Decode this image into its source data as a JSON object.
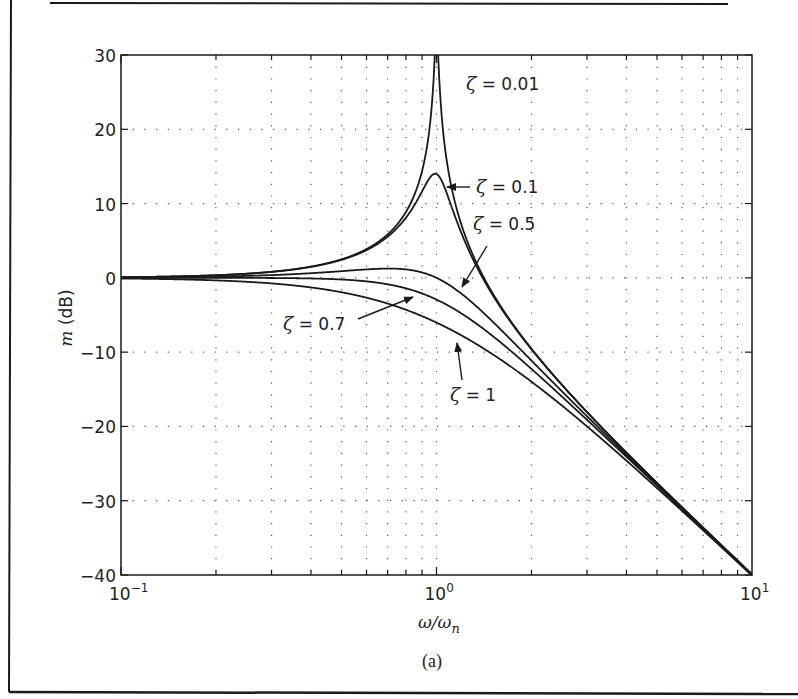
{
  "figure": {
    "caption": "(a)",
    "frame_color": "#1a1a1a",
    "curve_color": "#1a1a1a",
    "grid_color": "#555555"
  },
  "chart_data": {
    "type": "line",
    "title": "",
    "subtitle": "Second-order system magnitude response",
    "xlabel": "ω/ω",
    "xlabel_sub": "n",
    "ylabel_italic": "m",
    "ylabel_rest": " (dB)",
    "xscale": "log",
    "xlim": [
      0.1,
      10
    ],
    "ylim": [
      -40,
      30
    ],
    "grid": true,
    "grid_style": "dotted",
    "legend": "none (inline annotations with arrows)",
    "x_ticks": [
      {
        "value": 0.1,
        "base": "10",
        "exp": "−1"
      },
      {
        "value": 1,
        "base": "10",
        "exp": "0"
      },
      {
        "value": 10,
        "base": "10",
        "exp": "1"
      }
    ],
    "y_ticks": [
      {
        "value": 30,
        "label": "30"
      },
      {
        "value": 20,
        "label": "20"
      },
      {
        "value": 10,
        "label": "10"
      },
      {
        "value": 0,
        "label": "0"
      },
      {
        "value": -10,
        "label": "−10"
      },
      {
        "value": -20,
        "label": "−20"
      },
      {
        "value": -30,
        "label": "−30"
      },
      {
        "value": -40,
        "label": "−40"
      }
    ],
    "formula": "m = -20*log10(sqrt((1 - r^2)^2 + (2*zeta*r)^2)), r = ω/ωn",
    "x": [
      0.1,
      0.2,
      0.3,
      0.5,
      0.7,
      0.8,
      0.9,
      1.0,
      1.1,
      1.2,
      1.5,
      2,
      3,
      5,
      7,
      10
    ],
    "series": [
      {
        "name": "ζ = 0.01",
        "zeta": 0.01,
        "values": [
          0.09,
          0.35,
          0.82,
          2.5,
          5.85,
          8.87,
          14.42,
          33.98,
          13.58,
          7.65,
          2.07,
          -9.54,
          -18.06,
          -27.6,
          -33.62,
          -39.91
        ]
      },
      {
        "name": "ζ = 0.1",
        "zeta": 0.1,
        "values": [
          0.09,
          0.34,
          0.78,
          2.29,
          5.02,
          6.95,
          9.21,
          13.98,
          8.34,
          5.09,
          -2.1,
          -9.63,
          -18.08,
          -27.61,
          -33.62,
          -39.92
        ]
      },
      {
        "name": "ζ = 0.5",
        "zeta": 0.5,
        "values": [
          0.07,
          0.18,
          0.34,
          0.66,
          0.61,
          0.34,
          -0.09,
          0.0,
          -0.56,
          -1.55,
          -4.52,
          -10.61,
          -18.4,
          -27.73,
          -33.68,
          -39.97
        ]
      },
      {
        "name": "ζ = 0.7",
        "zeta": 0.7,
        "values": [
          0.0,
          0.0,
          0.0,
          -0.13,
          -0.75,
          -1.28,
          -1.99,
          -2.92,
          -3.85,
          -4.93,
          -7.9,
          -12.4,
          -19.2,
          -28.11,
          -33.97,
          -40.05
        ]
      },
      {
        "name": "ζ = 1",
        "zeta": 1.0,
        "values": [
          -0.09,
          -0.34,
          -0.75,
          -1.94,
          -3.51,
          -4.2,
          -4.95,
          -6.02,
          -6.94,
          -7.79,
          -10.71,
          -13.98,
          -20.0,
          -28.3,
          -34.04,
          -40.09
        ]
      }
    ],
    "annotations": [
      {
        "zeta_label": "ζ",
        "text": " = 0.01",
        "x": 466,
        "y": 90,
        "arrow": null
      },
      {
        "zeta_label": "ζ",
        "text": " = 0.1",
        "x": 476,
        "y": 193,
        "arrow": {
          "x1": 470,
          "y1": 187,
          "x2": 447,
          "y2": 187
        }
      },
      {
        "zeta_label": "ζ",
        "text": " = 0.5",
        "x": 473,
        "y": 230,
        "arrow": {
          "x1": 487,
          "y1": 246,
          "x2": 462,
          "y2": 287
        }
      },
      {
        "zeta_label": "ζ",
        "text": " = 0.7",
        "x": 283,
        "y": 330,
        "arrow": {
          "x1": 358,
          "y1": 319,
          "x2": 413,
          "y2": 297
        }
      },
      {
        "zeta_label": "ζ",
        "text": " = 1",
        "x": 450,
        "y": 401,
        "arrow": {
          "x1": 462,
          "y1": 380,
          "x2": 457,
          "y2": 343
        }
      }
    ]
  }
}
